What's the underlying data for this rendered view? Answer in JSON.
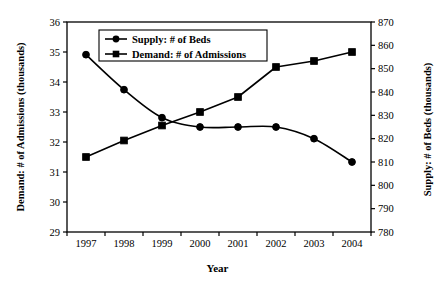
{
  "chart_data": {
    "type": "line",
    "title": "",
    "xlabel": "Year",
    "categories": [
      "1997",
      "1998",
      "1999",
      "2000",
      "2001",
      "2002",
      "2003",
      "2004"
    ],
    "grid": false,
    "legend_position": "top-center",
    "series": [
      {
        "name": "Supply: # of Beds",
        "marker": "circle",
        "axis": "right",
        "values": [
          856,
          841,
          829,
          825,
          825,
          825,
          820,
          810
        ]
      },
      {
        "name": "Demand: # of Admissions",
        "marker": "square",
        "axis": "left",
        "values": [
          31.5,
          32.05,
          32.55,
          33.0,
          33.5,
          34.5,
          34.7,
          35.0
        ]
      }
    ],
    "left_axis": {
      "label": "Demand: # of Admissions (thousands)",
      "ylim": [
        29,
        36
      ],
      "ticks": [
        "29",
        "30",
        "31",
        "32",
        "33",
        "34",
        "35",
        "36"
      ]
    },
    "right_axis": {
      "label": "Supply: # of Beds (thousands)",
      "ylim": [
        780,
        870
      ],
      "ticks": [
        "780",
        "790",
        "800",
        "810",
        "820",
        "830",
        "840",
        "850",
        "860",
        "870"
      ]
    },
    "colors": {
      "series": "#000000",
      "axis": "#000000",
      "background": "#ffffff"
    }
  }
}
